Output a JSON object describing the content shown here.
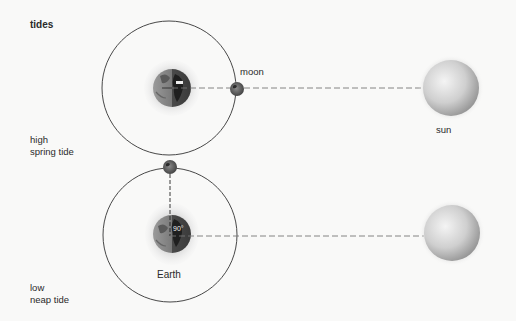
{
  "title": "tides",
  "panels": [
    {
      "id": "spring",
      "label_line1": "high",
      "label_line2": "spring tide",
      "moon_label": "moon",
      "sun_label": "sun",
      "alignment": "Sun, Moon and Earth in line"
    },
    {
      "id": "neap",
      "label_line1": "low",
      "label_line2": "neap tide",
      "earth_label": "Earth",
      "angle_label": "90°",
      "alignment": "Moon at right angle to Sun"
    }
  ],
  "colors": {
    "background": "#f9f9f8",
    "orbit": "#333333",
    "dash": "#777777",
    "text": "#2a2a2a"
  }
}
